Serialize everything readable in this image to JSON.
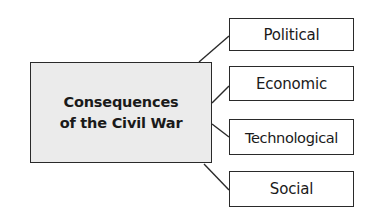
{
  "diagram": {
    "type": "concept-map",
    "central": {
      "lines": [
        "Consequences",
        "of the Civil War"
      ],
      "fill": "#ebebeb",
      "border": "#2a2a2a"
    },
    "branches": [
      {
        "label": "Political"
      },
      {
        "label": "Economic"
      },
      {
        "label": "Technological"
      },
      {
        "label": "Social"
      }
    ],
    "line_color": "#2a2a2a"
  }
}
